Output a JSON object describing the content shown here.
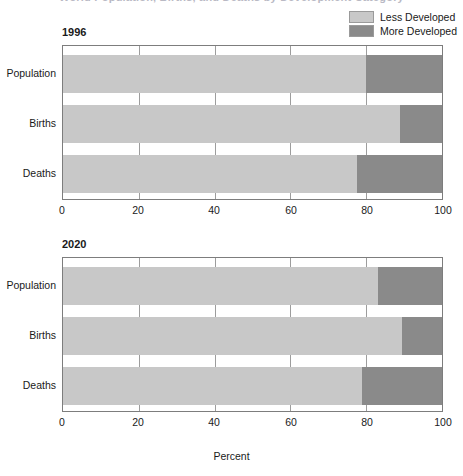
{
  "title": {
    "text": "World Population, Births, and Deaths by Development Category",
    "cut_off": true
  },
  "legend": {
    "position": "top-right",
    "items": [
      {
        "label": "Less Developed",
        "color": "#c8c8c8",
        "swatch_name": "legend-swatch-less-developed"
      },
      {
        "label": "More Developed",
        "color": "#8a8a8a",
        "swatch_name": "legend-swatch-more-developed"
      }
    ]
  },
  "axis": {
    "xlabel": "Percent",
    "ticks": [
      "0",
      "20",
      "40",
      "60",
      "80",
      "100"
    ],
    "xlim": [
      0,
      100
    ]
  },
  "panels": [
    {
      "title": "1996"
    },
    {
      "title": "2020"
    }
  ],
  "categories": [
    "Population",
    "Births",
    "Deaths"
  ],
  "chart_data": {
    "type": "bar",
    "orientation": "horizontal",
    "stacked": true,
    "title": "World Population, Births, and Deaths by Development Category",
    "xlabel": "Percent",
    "ylabel": "",
    "xlim": [
      0,
      100
    ],
    "grid": true,
    "legend_position": "top-right",
    "categories": [
      "Population",
      "Births",
      "Deaths"
    ],
    "panels": [
      {
        "title": "1996",
        "series": [
          {
            "name": "Less Developed",
            "color": "#c8c8c8",
            "values": [
              80,
              89,
              77.5
            ]
          },
          {
            "name": "More Developed",
            "color": "#8a8a8a",
            "values": [
              20,
              11,
              22.5
            ]
          }
        ]
      },
      {
        "title": "2020",
        "series": [
          {
            "name": "Less Developed",
            "color": "#c8c8c8",
            "values": [
              83,
              89.5,
              79
            ]
          },
          {
            "name": "More Developed",
            "color": "#8a8a8a",
            "values": [
              17,
              10.5,
              21
            ]
          }
        ]
      }
    ]
  }
}
